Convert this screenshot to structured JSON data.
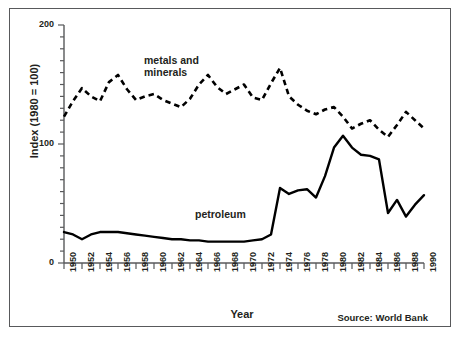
{
  "figure": {
    "source_note": "Source: World Bank"
  },
  "chart_data": {
    "type": "line",
    "title": "",
    "xlabel": "Year",
    "ylabel": "Index (1980 = 100)",
    "xlim": [
      1950,
      1990
    ],
    "ylim": [
      0,
      200
    ],
    "yticks": [
      0,
      100,
      200
    ],
    "ytick_labels": [
      "0",
      "100",
      "200"
    ],
    "yminor_step": 10,
    "xticks": [
      1950,
      1952,
      1954,
      1956,
      1958,
      1960,
      1962,
      1964,
      1966,
      1968,
      1970,
      1972,
      1974,
      1976,
      1978,
      1980,
      1982,
      1984,
      1986,
      1988,
      1990
    ],
    "xtick_labels": [
      "1950",
      "1952",
      "1954",
      "1956",
      "1958",
      "1960",
      "1962",
      "1964",
      "1966",
      "1968",
      "1970",
      "1972",
      "1974",
      "1976",
      "1978",
      "1980",
      "1982",
      "1984",
      "1986",
      "1988",
      "1990"
    ],
    "xminor_step": 1,
    "grid": false,
    "legend": "inline-annotations",
    "annotations": [
      {
        "text": "metals and\nminerals",
        "series": "metals and minerals",
        "x": 1962,
        "y": 178
      },
      {
        "text": "petroleum",
        "series": "petroleum",
        "x": 1966,
        "y": 52
      }
    ],
    "x": [
      1950,
      1951,
      1952,
      1953,
      1954,
      1955,
      1956,
      1957,
      1958,
      1959,
      1960,
      1961,
      1962,
      1963,
      1964,
      1965,
      1966,
      1967,
      1968,
      1969,
      1970,
      1971,
      1972,
      1973,
      1974,
      1975,
      1976,
      1977,
      1978,
      1979,
      1980,
      1981,
      1982,
      1983,
      1984,
      1985,
      1986,
      1987,
      1988,
      1989,
      1990
    ],
    "series": [
      {
        "name": "metals and minerals",
        "style": "dashed",
        "color": "#000000",
        "values": [
          123,
          136,
          147,
          140,
          136,
          152,
          158,
          146,
          137,
          140,
          142,
          137,
          134,
          131,
          138,
          150,
          158,
          148,
          142,
          146,
          150,
          139,
          137,
          151,
          164,
          140,
          133,
          128,
          125,
          129,
          131,
          123,
          113,
          117,
          120,
          112,
          106,
          116,
          127,
          120,
          113
        ]
      },
      {
        "name": "petroleum",
        "style": "solid",
        "color": "#000000",
        "values": [
          26,
          24,
          20,
          24,
          26,
          26,
          26,
          25,
          24,
          23,
          22,
          21,
          20,
          20,
          19,
          19,
          18,
          18,
          18,
          18,
          18,
          19,
          20,
          24,
          63,
          58,
          61,
          62,
          55,
          73,
          97,
          107,
          97,
          91,
          90,
          87,
          42,
          53,
          39,
          49,
          57
        ]
      }
    ]
  }
}
